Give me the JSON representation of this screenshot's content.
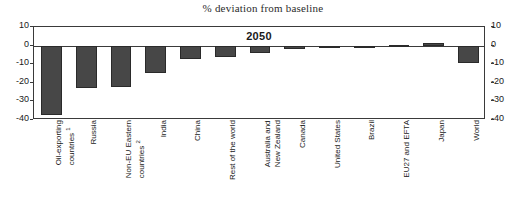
{
  "chart_data": {
    "type": "bar",
    "title": "% deviation from baseline",
    "period_label": "2050",
    "xlabel": "",
    "ylabel": "",
    "ylim": [
      -40,
      10
    ],
    "yticks": [
      10,
      0,
      -10,
      -20,
      -30,
      -40
    ],
    "ytick_labels": [
      "10",
      "0",
      "-10",
      "-20",
      "-30",
      "-40"
    ],
    "grid": false,
    "legend": "none",
    "dual_axis": true,
    "bar_color": "#474747",
    "categories": [
      "Oil-exporting countries",
      "Russia",
      "Non-EU Eastern countries",
      "India",
      "China",
      "Rest of the world",
      "Australia and New Zealand",
      "Canada",
      "United States",
      "Brazil",
      "EU27 and EFTA",
      "Japan",
      "World"
    ],
    "values": [
      -37.5,
      -22.8,
      -22.5,
      -15.0,
      -7.0,
      -6.0,
      -4.0,
      -2.0,
      -0.1,
      -0.1,
      0.6,
      1.6,
      -9.2
    ],
    "footnote_markers": {
      "Oil-exporting countries": "1",
      "Non-EU Eastern countries": "2"
    }
  },
  "axes": {
    "left_labels": [
      "10",
      "0",
      "-10",
      "-20",
      "-30",
      "-40"
    ],
    "right_labels": [
      "10",
      "0",
      "-10",
      "-20",
      "-30",
      "-40"
    ]
  },
  "category_lines": [
    [
      "Oil-exporting",
      "countries",
      "1"
    ],
    [
      "Russia",
      "",
      ""
    ],
    [
      "Non-EU Eastern",
      "countries",
      "2"
    ],
    [
      "India",
      "",
      ""
    ],
    [
      "China",
      "",
      ""
    ],
    [
      "Rest of the world",
      "",
      ""
    ],
    [
      "Australia and",
      "New Zealand",
      ""
    ],
    [
      "Canada",
      "",
      ""
    ],
    [
      "United States",
      "",
      ""
    ],
    [
      "Brazil",
      "",
      ""
    ],
    [
      "EU27 and EFTA",
      "",
      ""
    ],
    [
      "Japan",
      "",
      ""
    ],
    [
      "World",
      "",
      ""
    ]
  ]
}
